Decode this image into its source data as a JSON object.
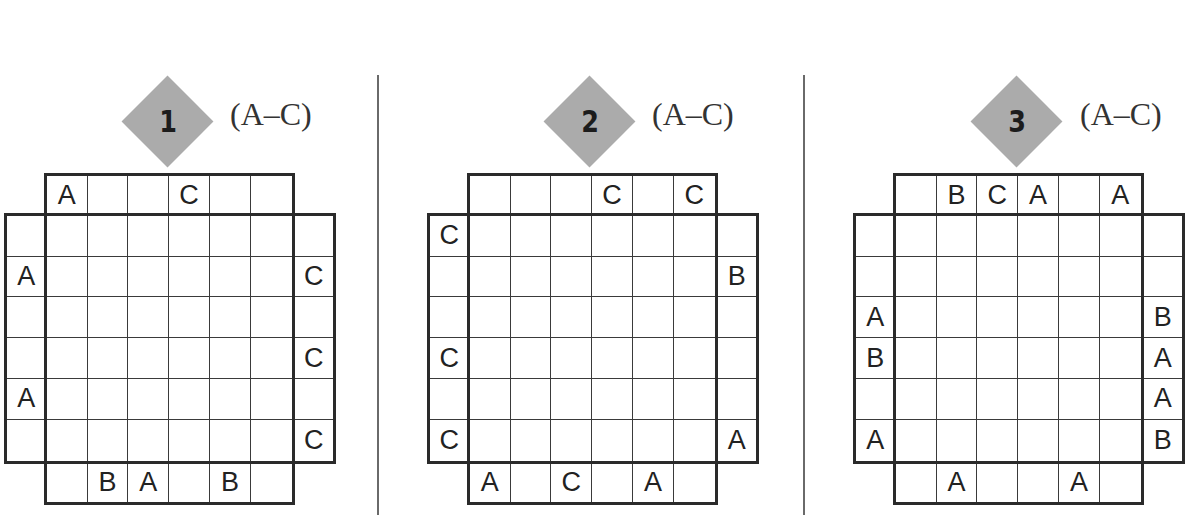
{
  "puzzles": [
    {
      "number": "1",
      "range": "(A–C)",
      "clues": {
        "top": [
          "A",
          "",
          "",
          "C",
          "",
          ""
        ],
        "bottom": [
          "",
          "B",
          "A",
          "",
          "B",
          ""
        ],
        "left": [
          "",
          "A",
          "",
          "",
          "A",
          ""
        ],
        "right": [
          "",
          "C",
          "",
          "C",
          "",
          "C"
        ]
      },
      "grid": [
        [
          "",
          "",
          "",
          "",
          "",
          ""
        ],
        [
          "",
          "",
          "",
          "",
          "",
          ""
        ],
        [
          "",
          "",
          "",
          "",
          "",
          ""
        ],
        [
          "",
          "",
          "",
          "",
          "",
          ""
        ],
        [
          "",
          "",
          "",
          "",
          "",
          ""
        ],
        [
          "",
          "",
          "",
          "",
          "",
          ""
        ]
      ]
    },
    {
      "number": "2",
      "range": "(A–C)",
      "clues": {
        "top": [
          "",
          "",
          "",
          "C",
          "",
          "C"
        ],
        "bottom": [
          "A",
          "",
          "C",
          "",
          "A",
          ""
        ],
        "left": [
          "C",
          "",
          "",
          "C",
          "",
          "C"
        ],
        "right": [
          "",
          "B",
          "",
          "",
          "",
          "A"
        ]
      },
      "grid": [
        [
          "",
          "",
          "",
          "",
          "",
          ""
        ],
        [
          "",
          "",
          "",
          "",
          "",
          ""
        ],
        [
          "",
          "",
          "",
          "",
          "",
          ""
        ],
        [
          "",
          "",
          "",
          "",
          "",
          ""
        ],
        [
          "",
          "",
          "",
          "",
          "",
          ""
        ],
        [
          "",
          "",
          "",
          "",
          "",
          ""
        ]
      ]
    },
    {
      "number": "3",
      "range": "(A–C)",
      "clues": {
        "top": [
          "",
          "B",
          "C",
          "A",
          "",
          "A"
        ],
        "bottom": [
          "",
          "A",
          "",
          "",
          "A",
          ""
        ],
        "left": [
          "",
          "",
          "A",
          "B",
          "",
          "A"
        ],
        "right": [
          "",
          "",
          "B",
          "A",
          "A",
          "B"
        ]
      },
      "grid": [
        [
          "",
          "",
          "",
          "",
          "",
          ""
        ],
        [
          "",
          "",
          "",
          "",
          "",
          ""
        ],
        [
          "",
          "",
          "",
          "",
          "",
          ""
        ],
        [
          "",
          "",
          "",
          "",
          "",
          ""
        ],
        [
          "",
          "",
          "",
          "",
          "",
          ""
        ],
        [
          "",
          "",
          "",
          "",
          "",
          ""
        ]
      ]
    }
  ],
  "colors": {
    "badge_fill": "#ababab",
    "grid_line": "#2a2a2a",
    "divider": "#6a6a6a"
  }
}
